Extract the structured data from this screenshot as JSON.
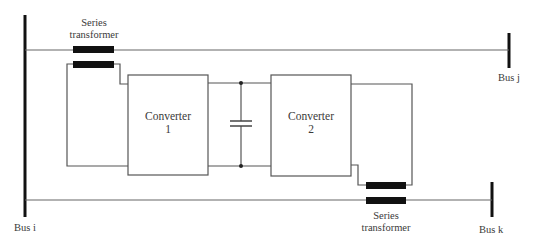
{
  "diagram": {
    "type": "UPFC / interline power flow controller schematic",
    "colors": {
      "line": "#555555",
      "bus": "#111111",
      "transformer": "#111111",
      "text": "#3a3a3a"
    },
    "buses": [
      {
        "id": "bus_i",
        "label": "Bus i"
      },
      {
        "id": "bus_j",
        "label": "Bus j"
      },
      {
        "id": "bus_k",
        "label": "Bus k"
      }
    ],
    "transformers": [
      {
        "id": "upper_series_transformer",
        "label_line1": "Series",
        "label_line2": "transformer"
      },
      {
        "id": "lower_series_transformer",
        "label_line1": "Series",
        "label_line2": "transformer"
      }
    ],
    "converters": [
      {
        "id": "converter_1",
        "label_line1": "Converter",
        "label_line2": "1"
      },
      {
        "id": "converter_2",
        "label_line1": "Converter",
        "label_line2": "2"
      }
    ],
    "dc_link": {
      "element": "capacitor"
    }
  }
}
